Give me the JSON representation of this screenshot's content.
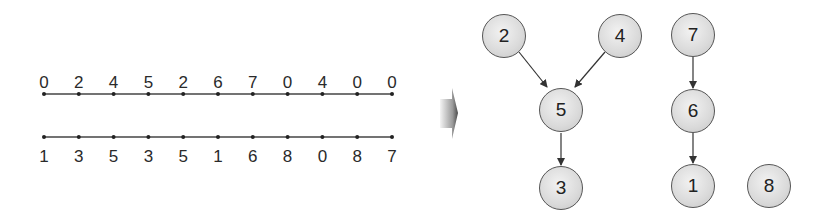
{
  "left_panel": {
    "top_line": {
      "labels": [
        "0",
        "2",
        "4",
        "5",
        "2",
        "6",
        "7",
        "0",
        "4",
        "0",
        "0"
      ]
    },
    "bottom_line": {
      "labels": [
        "1",
        "3",
        "5",
        "3",
        "5",
        "1",
        "6",
        "8",
        "0",
        "8",
        "7"
      ]
    }
  },
  "transition_arrow": {
    "icon": "right-arrow-icon",
    "gradient_from": "#f0f0f0",
    "gradient_to": "#555555"
  },
  "graph": {
    "nodes": [
      {
        "id": "2",
        "label": "2"
      },
      {
        "id": "4",
        "label": "4"
      },
      {
        "id": "5",
        "label": "5"
      },
      {
        "id": "3",
        "label": "3"
      },
      {
        "id": "7",
        "label": "7"
      },
      {
        "id": "6",
        "label": "6"
      },
      {
        "id": "1",
        "label": "1"
      },
      {
        "id": "8",
        "label": "8"
      }
    ],
    "edges": [
      {
        "from": "2",
        "to": "5"
      },
      {
        "from": "4",
        "to": "5"
      },
      {
        "from": "5",
        "to": "3"
      },
      {
        "from": "7",
        "to": "6"
      },
      {
        "from": "6",
        "to": "1"
      }
    ]
  },
  "colors": {
    "line": "#444444",
    "node_border": "#555555",
    "node_fill": "#dadada",
    "text": "#222222"
  }
}
